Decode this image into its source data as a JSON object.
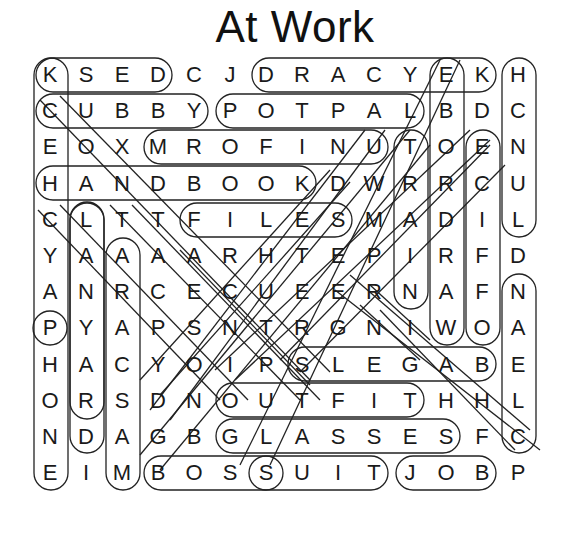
{
  "title": "At Work",
  "grid": {
    "rows": 12,
    "cols": 13,
    "letters": [
      [
        "K",
        "S",
        "E",
        "D",
        "C",
        "J",
        "D",
        "R",
        "A",
        "C",
        "Y",
        "E",
        "K",
        "H"
      ],
      [
        "C",
        "U",
        "B",
        "B",
        "Y",
        "P",
        "O",
        "T",
        "P",
        "A",
        "L",
        "B",
        "D",
        "C"
      ],
      [
        "E",
        "O",
        "X",
        "M",
        "R",
        "O",
        "F",
        "I",
        "N",
        "U",
        "T",
        "O",
        "E",
        "N"
      ],
      [
        "H",
        "A",
        "N",
        "D",
        "B",
        "O",
        "O",
        "K",
        "D",
        "W",
        "R",
        "R",
        "C",
        "U"
      ],
      [
        "C",
        "L",
        "T",
        "T",
        "F",
        "I",
        "L",
        "E",
        "S",
        "M",
        "A",
        "D",
        "I",
        "L"
      ],
      [
        "Y",
        "A",
        "A",
        "A",
        "A",
        "R",
        "H",
        "T",
        "E",
        "P",
        "I",
        "R",
        "F",
        "D"
      ],
      [
        "A",
        "N",
        "R",
        "C",
        "E",
        "C",
        "U",
        "E",
        "E",
        "R",
        "N",
        "A",
        "F",
        "N"
      ],
      [
        "P",
        "Y",
        "A",
        "P",
        "S",
        "N",
        "T",
        "R",
        "G",
        "N",
        "I",
        "W",
        "O",
        "A"
      ],
      [
        "H",
        "A",
        "C",
        "Y",
        "O",
        "I",
        "P",
        "S",
        "L",
        "E",
        "G",
        "A",
        "B",
        "E"
      ],
      [
        "O",
        "R",
        "S",
        "D",
        "N",
        "O",
        "U",
        "T",
        "F",
        "I",
        "T",
        "H",
        "H",
        "L"
      ],
      [
        "N",
        "D",
        "A",
        "G",
        "B",
        "G",
        "L",
        "A",
        "S",
        "S",
        "E",
        "S",
        "F",
        "C"
      ],
      [
        "E",
        "I",
        "M",
        "B",
        "O",
        "S",
        "S",
        "U",
        "I",
        "T",
        "J",
        "O",
        "B",
        "P"
      ]
    ]
  },
  "found_words": [
    {
      "word": "KSED",
      "start": [
        0,
        0
      ],
      "end": [
        0,
        3
      ],
      "dir": "horizontal"
    },
    {
      "word": "DRACYEK",
      "start": [
        0,
        6
      ],
      "end": [
        0,
        12
      ],
      "dir": "horizontal"
    },
    {
      "word": "CUBBY",
      "start": [
        1,
        0
      ],
      "end": [
        1,
        4
      ],
      "dir": "horizontal"
    },
    {
      "word": "POTPAL",
      "start": [
        1,
        5
      ],
      "end": [
        1,
        10
      ],
      "dir": "horizontal"
    },
    {
      "word": "MROFINU",
      "start": [
        2,
        3
      ],
      "end": [
        2,
        9
      ],
      "dir": "horizontal"
    },
    {
      "word": "HANDBOOK",
      "start": [
        3,
        0
      ],
      "end": [
        3,
        7
      ],
      "dir": "horizontal"
    },
    {
      "word": "FILES",
      "start": [
        4,
        4
      ],
      "end": [
        4,
        8
      ],
      "dir": "horizontal"
    },
    {
      "word": "SLEGAB",
      "start": [
        8,
        7
      ],
      "end": [
        8,
        12
      ],
      "dir": "horizontal"
    },
    {
      "word": "OUTFIT",
      "start": [
        9,
        5
      ],
      "end": [
        9,
        10
      ],
      "dir": "horizontal"
    },
    {
      "word": "GLASSES",
      "start": [
        10,
        5
      ],
      "end": [
        10,
        11
      ],
      "dir": "horizontal"
    },
    {
      "word": "BOSS",
      "start": [
        11,
        3
      ],
      "end": [
        11,
        6
      ],
      "dir": "horizontal"
    },
    {
      "word": "SUIT",
      "start": [
        11,
        6
      ],
      "end": [
        11,
        9
      ],
      "dir": "horizontal"
    },
    {
      "word": "JOB",
      "start": [
        11,
        10
      ],
      "end": [
        11,
        12
      ],
      "dir": "horizontal"
    },
    {
      "word": "KCEHCYAPHONE",
      "start": [
        0,
        0
      ],
      "end": [
        11,
        0
      ],
      "dir": "vertical"
    },
    {
      "word": "ULANYARD",
      "start": [
        3,
        1
      ],
      "end": [
        10,
        1
      ],
      "dir": "vertical"
    },
    {
      "word": "LTARACSAM",
      "start": [
        4,
        1
      ],
      "end": [
        11,
        2
      ],
      "dir": "vertical"
    },
    {
      "word": "ARACSAM",
      "start": [
        5,
        2
      ],
      "end": [
        11,
        2
      ],
      "dir": "vertical"
    },
    {
      "word": "TRAIN",
      "start": [
        2,
        10
      ],
      "end": [
        6,
        10
      ],
      "dir": "vertical"
    },
    {
      "word": "EBORDRAW",
      "start": [
        0,
        11
      ],
      "end": [
        7,
        11
      ],
      "dir": "vertical"
    },
    {
      "word": "ECIFFO",
      "start": [
        2,
        12
      ],
      "end": [
        7,
        12
      ],
      "dir": "vertical"
    },
    {
      "word": "HCNUL",
      "start": [
        0,
        13
      ],
      "end": [
        4,
        13
      ],
      "dir": "vertical"
    },
    {
      "word": "NAELC",
      "start": [
        6,
        13
      ],
      "end": [
        10,
        13
      ],
      "dir": "vertical"
    },
    {
      "word": "P",
      "start": [
        7,
        0
      ],
      "end": [
        7,
        0
      ],
      "dir": "single"
    },
    {
      "word": "CONTRACT",
      "start": [
        1,
        0
      ],
      "end": [
        8,
        7
      ],
      "dir": "diag-down-right"
    },
    {
      "word": "TAPE",
      "start": [
        4,
        2
      ],
      "end": [
        7,
        3
      ],
      "dir": "diag"
    },
    {
      "word": "RNWO",
      "start": [
        6,
        9
      ],
      "end": [
        7,
        12
      ],
      "dir": "diag-down-right"
    },
    {
      "word": "HABC",
      "start": [
        7,
        10
      ],
      "end": [
        10,
        13
      ],
      "dir": "diag-down-right"
    }
  ],
  "colors": {
    "letter": "#1a1a1a",
    "outline": "#222222",
    "background": "#ffffff"
  }
}
